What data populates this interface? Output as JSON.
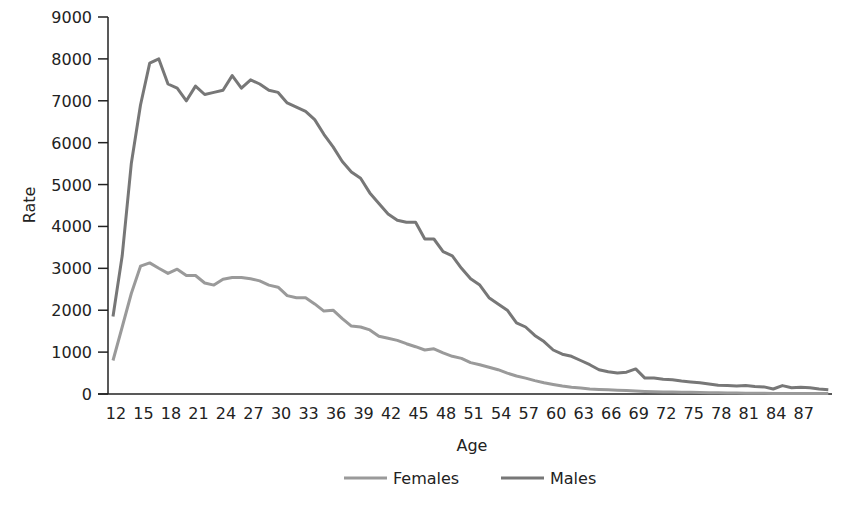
{
  "chart_data": {
    "type": "line",
    "title": "",
    "xlabel": "Age",
    "ylabel": "Rate",
    "ylim": [
      0,
      9000
    ],
    "yticks": [
      0,
      1000,
      2000,
      3000,
      4000,
      5000,
      6000,
      7000,
      8000,
      9000
    ],
    "xlim": [
      12,
      90
    ],
    "xticks": [
      12,
      15,
      18,
      21,
      24,
      27,
      30,
      33,
      36,
      39,
      42,
      45,
      48,
      51,
      54,
      57,
      60,
      63,
      66,
      69,
      72,
      75,
      78,
      81,
      84,
      87
    ],
    "grid": false,
    "legend_position": "bottom",
    "x": [
      12,
      13,
      14,
      15,
      16,
      17,
      18,
      19,
      20,
      21,
      22,
      23,
      24,
      25,
      26,
      27,
      28,
      29,
      30,
      31,
      32,
      33,
      34,
      35,
      36,
      37,
      38,
      39,
      40,
      41,
      42,
      43,
      44,
      45,
      46,
      47,
      48,
      49,
      50,
      51,
      52,
      53,
      54,
      55,
      56,
      57,
      58,
      59,
      60,
      61,
      62,
      63,
      64,
      65,
      66,
      67,
      68,
      69,
      70,
      71,
      72,
      73,
      74,
      75,
      76,
      77,
      78,
      79,
      80,
      81,
      82,
      83,
      84,
      85,
      86,
      87,
      88,
      89,
      90
    ],
    "series": [
      {
        "name": "Females",
        "color": "#9a9a9a",
        "values": [
          800,
          1600,
          2400,
          3050,
          3130,
          3000,
          2880,
          2980,
          2830,
          2830,
          2650,
          2600,
          2740,
          2780,
          2780,
          2750,
          2700,
          2600,
          2550,
          2350,
          2300,
          2300,
          2150,
          1980,
          2000,
          1800,
          1620,
          1600,
          1530,
          1380,
          1330,
          1280,
          1200,
          1130,
          1050,
          1080,
          980,
          900,
          850,
          750,
          700,
          640,
          580,
          500,
          430,
          380,
          320,
          270,
          230,
          190,
          160,
          140,
          120,
          110,
          100,
          90,
          80,
          70,
          60,
          55,
          50,
          45,
          40,
          40,
          35,
          30,
          30,
          25,
          25,
          20,
          20,
          20,
          15,
          15,
          15,
          15,
          15,
          15,
          15
        ]
      },
      {
        "name": "Males",
        "color": "#777777",
        "values": [
          1850,
          3300,
          5500,
          6900,
          7900,
          8000,
          7400,
          7300,
          7000,
          7350,
          7150,
          7200,
          7250,
          7600,
          7300,
          7500,
          7400,
          7250,
          7200,
          6950,
          6850,
          6750,
          6550,
          6200,
          5900,
          5550,
          5300,
          5150,
          4800,
          4550,
          4300,
          4150,
          4100,
          4100,
          3700,
          3700,
          3400,
          3300,
          3000,
          2750,
          2600,
          2300,
          2150,
          2000,
          1700,
          1600,
          1400,
          1250,
          1050,
          950,
          900,
          800,
          700,
          580,
          530,
          500,
          520,
          600,
          380,
          380,
          350,
          340,
          310,
          290,
          270,
          240,
          210,
          200,
          190,
          200,
          180,
          170,
          120,
          200,
          150,
          160,
          150,
          120,
          100
        ]
      }
    ]
  },
  "legend": {
    "items": [
      {
        "label": "Females",
        "color": "#9a9a9a"
      },
      {
        "label": "Males",
        "color": "#777777"
      }
    ]
  }
}
